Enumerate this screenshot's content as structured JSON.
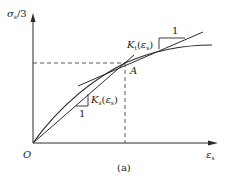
{
  "figure": {
    "caption": "(a)",
    "y_axis_label": {
      "main": "σ",
      "sub": "s",
      "suffix": "/3"
    },
    "x_axis_label": {
      "main": "ε",
      "sub": "s"
    },
    "origin_label": "O",
    "point_label": "A",
    "tangent_label": {
      "prefix": "K",
      "sub": "t",
      "arg_main": "ε",
      "arg_sub": "s"
    },
    "secant_label": {
      "prefix": "K",
      "sub": "s",
      "arg_main": "ε",
      "arg_sub": "s"
    },
    "slope_unit_top": "1",
    "slope_unit_bottom": "1",
    "colors": {
      "line": "#2a2a2a",
      "dashed": "#444444",
      "text": "#222222"
    }
  }
}
